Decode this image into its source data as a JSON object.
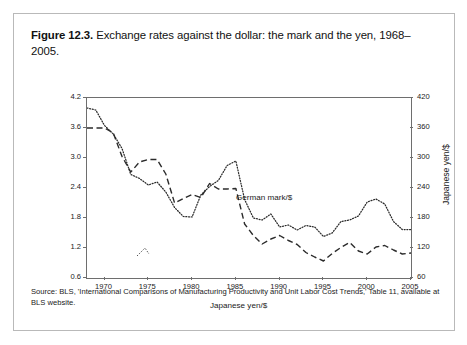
{
  "figure": {
    "number_label": "Figure 12.3.",
    "caption": "Exchange rates against the dollar: the mark and the yen, 1968–2005.",
    "source_note": "Source: BLS, 'International Comparisons of Manufacturing Productivity and Unit Labor Cost Trends,' Table 11, available at BLS website."
  },
  "chart_data": {
    "type": "line",
    "title": "Exchange rates against the dollar: the mark and the yen, 1968–2005",
    "xlabel": "",
    "ylabel": "German mark/$",
    "ylabel_right": "Japanese yen/$",
    "xlim": [
      1968,
      2005
    ],
    "ylim": [
      0.6,
      4.2
    ],
    "ylim_right": [
      60,
      420
    ],
    "grid": false,
    "legend": "inline-annotations",
    "xticks": [
      1970,
      1975,
      1980,
      1985,
      1990,
      1995,
      2000,
      2005
    ],
    "xtick_labels": [
      "1970",
      "1975",
      "1980",
      "1985",
      "1990",
      "1995",
      "2000",
      "2005"
    ],
    "yticks": [
      0.6,
      1.2,
      1.8,
      2.4,
      3.0,
      3.6,
      4.2
    ],
    "ytick_labels": [
      "0.6",
      "1.2",
      "1.8",
      "2.4",
      "3.0",
      "3.6",
      "4.2"
    ],
    "yticks_right": [
      60,
      120,
      180,
      240,
      300,
      360,
      420
    ],
    "ytick_labels_right": [
      "60",
      "120",
      "180",
      "240",
      "300",
      "360",
      "420"
    ],
    "annotations": [
      {
        "text": "German mark/$",
        "x": 1986.5,
        "y": 3.15
      },
      {
        "text": "Japanese yen/$",
        "x": 1983.5,
        "y": 1.12
      }
    ],
    "x": [
      1968,
      1969,
      1970,
      1971,
      1972,
      1973,
      1974,
      1975,
      1976,
      1977,
      1978,
      1979,
      1980,
      1981,
      1982,
      1983,
      1984,
      1985,
      1986,
      1987,
      1988,
      1989,
      1990,
      1991,
      1992,
      1993,
      1994,
      1995,
      1996,
      1997,
      1998,
      1999,
      2000,
      2001,
      2002,
      2003,
      2004,
      2005
    ],
    "series": [
      {
        "name": "German mark/$",
        "axis": "left",
        "style": "dotted",
        "units": "marks per dollar",
        "values": [
          4.0,
          3.96,
          3.65,
          3.48,
          3.19,
          2.67,
          2.59,
          2.46,
          2.52,
          2.32,
          2.01,
          1.83,
          1.82,
          2.26,
          2.43,
          2.55,
          2.85,
          2.94,
          2.17,
          1.8,
          1.76,
          1.88,
          1.62,
          1.66,
          1.56,
          1.65,
          1.62,
          1.43,
          1.5,
          1.73,
          1.76,
          1.84,
          2.12,
          2.18,
          2.08,
          1.73,
          1.57,
          1.57
        ]
      },
      {
        "name": "Japanese yen/$",
        "axis": "right",
        "style": "dashed",
        "units": "yen per dollar",
        "values": [
          360,
          360,
          360,
          350,
          303,
          272,
          292,
          297,
          297,
          268,
          210,
          219,
          227,
          221,
          249,
          238,
          238,
          239,
          168,
          145,
          128,
          138,
          145,
          135,
          127,
          111,
          102,
          94,
          109,
          121,
          131,
          114,
          108,
          122,
          125,
          116,
          108,
          110
        ]
      }
    ]
  },
  "axes": {
    "left_title": "German mark/$",
    "right_title": "Japanese yen/$"
  }
}
